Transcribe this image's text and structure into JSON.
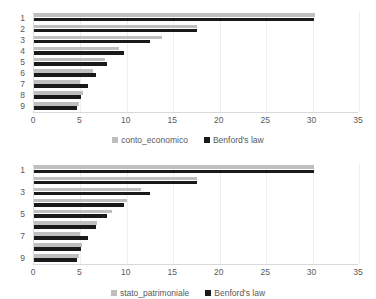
{
  "chart_data": [
    {
      "type": "bar",
      "orientation": "horizontal",
      "title": "",
      "xlabel": "",
      "ylabel": "",
      "categories": [
        "1",
        "2",
        "3",
        "4",
        "5",
        "6",
        "7",
        "8",
        "9"
      ],
      "y_tick_labels": [
        "1",
        "2",
        "3",
        "4",
        "5",
        "6",
        "7",
        "8",
        "9"
      ],
      "x_tick_labels": [
        "0",
        "5",
        "10",
        "15",
        "20",
        "25",
        "30",
        "35"
      ],
      "x_ticks": [
        0,
        5,
        10,
        15,
        20,
        25,
        30,
        35
      ],
      "xlim": [
        0,
        35
      ],
      "grid": true,
      "legend_position": "bottom",
      "series": [
        {
          "name": "conto_economico",
          "color": "#bfbfbf",
          "values": [
            30.3,
            17.6,
            13.8,
            9.1,
            7.6,
            6.4,
            5.0,
            5.3,
            4.8
          ]
        },
        {
          "name": "Benford's law",
          "color": "#1a1a1a",
          "values": [
            30.1,
            17.6,
            12.5,
            9.7,
            7.9,
            6.7,
            5.8,
            5.1,
            4.6
          ]
        }
      ]
    },
    {
      "type": "bar",
      "orientation": "horizontal",
      "title": "",
      "xlabel": "",
      "ylabel": "",
      "categories": [
        "1",
        "2",
        "3",
        "4",
        "5",
        "6",
        "7",
        "8",
        "9"
      ],
      "y_tick_labels": [
        "1",
        "",
        "3",
        "",
        "5",
        "",
        "7",
        "",
        "9"
      ],
      "x_tick_labels": [
        "0",
        "5",
        "10",
        "15",
        "20",
        "25",
        "30",
        "35"
      ],
      "x_ticks": [
        0,
        5,
        10,
        15,
        20,
        25,
        30,
        35
      ],
      "xlim": [
        0,
        35
      ],
      "grid": true,
      "legend_position": "bottom",
      "series": [
        {
          "name": "stato_patrimoniale",
          "color": "#bfbfbf",
          "values": [
            30.2,
            17.6,
            11.5,
            10.0,
            8.4,
            6.8,
            5.0,
            5.2,
            4.8
          ]
        },
        {
          "name": "Benford's law",
          "color": "#1a1a1a",
          "values": [
            30.1,
            17.6,
            12.5,
            9.7,
            7.9,
            6.7,
            5.8,
            5.1,
            4.6
          ]
        }
      ]
    }
  ]
}
